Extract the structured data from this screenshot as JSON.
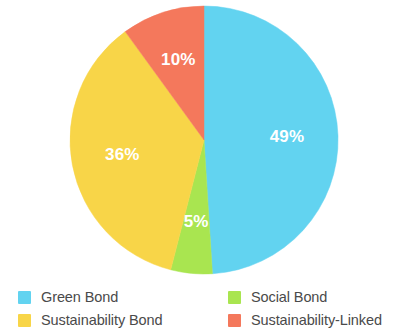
{
  "chart_data": {
    "type": "pie",
    "title": "",
    "subtitle": "",
    "xlabel": "",
    "ylabel": "",
    "grid": false,
    "legend_position": "bottom",
    "start_angle_deg": 0,
    "direction": "clockwise",
    "value_unit": "%",
    "categories": [
      "Green Bond",
      "Social Bond",
      "Sustainability Bond",
      "Sustainability-Linked"
    ],
    "values": [
      49,
      5,
      36,
      10
    ],
    "labels": [
      "49%",
      "5%",
      "36%",
      "10%"
    ],
    "colors": [
      "#62D3F0",
      "#A9E550",
      "#F8D548",
      "#F4785C"
    ],
    "slices": [
      {
        "name": "Green Bond",
        "value": 49,
        "label": "49%",
        "color": "#62D3F0"
      },
      {
        "name": "Social Bond",
        "value": 5,
        "label": "5%",
        "color": "#A9E550"
      },
      {
        "name": "Sustainability Bond",
        "value": 36,
        "label": "36%",
        "color": "#F8D548"
      },
      {
        "name": "Sustainability-Linked",
        "value": 10,
        "label": "10%",
        "color": "#F4785C"
      }
    ]
  },
  "legend": {
    "columns": [
      {
        "items": [
          {
            "label": "Green Bond",
            "color": "#62D3F0"
          },
          {
            "label": "Sustainability Bond",
            "color": "#F8D548"
          }
        ]
      },
      {
        "items": [
          {
            "label": "Social Bond",
            "color": "#A9E550"
          },
          {
            "label": "Sustainability-Linked",
            "color": "#F4785C"
          }
        ]
      }
    ]
  }
}
